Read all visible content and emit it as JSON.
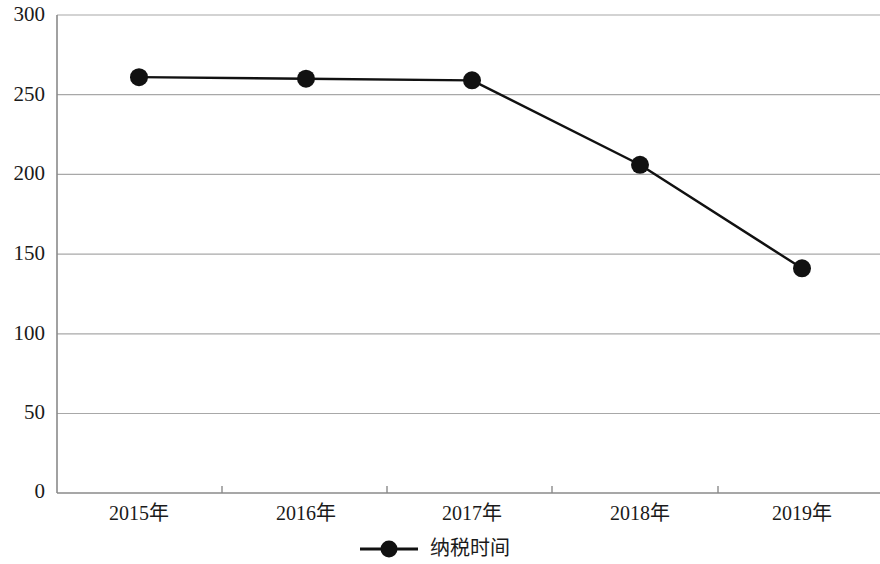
{
  "chart_data": {
    "type": "line",
    "title": "",
    "subtitle": "",
    "xlabel": "",
    "ylabel": "",
    "categories": [
      "2015年",
      "2016年",
      "2017年",
      "2018年",
      "2019年"
    ],
    "series": [
      {
        "name": "纳税时间",
        "values": [
          261,
          260,
          259,
          206,
          141
        ],
        "color": "#111111",
        "marker": "circle"
      }
    ],
    "ylim": [
      0,
      300
    ],
    "yticks": [
      0,
      50,
      100,
      150,
      200,
      250,
      300
    ],
    "ytick_labels": [
      "0",
      "50",
      "100",
      "150",
      "200",
      "250",
      "300"
    ],
    "grid": true,
    "grid_color": "#a6a6a6",
    "axis_color": "#7a7a7a",
    "legend": {
      "entries": [
        "纳税时间"
      ],
      "position": "bottom-center"
    }
  },
  "axes": {
    "y_tick_0": "0",
    "y_tick_1": "50",
    "y_tick_2": "100",
    "y_tick_3": "150",
    "y_tick_4": "200",
    "y_tick_5": "250",
    "y_tick_6": "300",
    "x_tick_0": "2015年",
    "x_tick_1": "2016年",
    "x_tick_2": "2017年",
    "x_tick_3": "2018年",
    "x_tick_4": "2019年"
  },
  "legend": {
    "series_label": "纳税时间"
  }
}
